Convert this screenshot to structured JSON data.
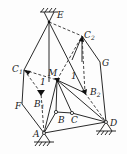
{
  "diagram": {
    "type": "linkage-mechanism",
    "points": {
      "E": {
        "label": "E",
        "x": 49,
        "y": 22
      },
      "C2": {
        "label": "C",
        "sub": "2",
        "x": 82,
        "y": 36
      },
      "G": {
        "label": "G",
        "x": 100,
        "y": 62
      },
      "C1": {
        "label": "C",
        "sub": "1",
        "x": 24,
        "y": 70
      },
      "M": {
        "label": "M",
        "x": 57,
        "y": 80
      },
      "B1": {
        "label": "B",
        "sub": "1",
        "x": 41,
        "y": 93
      },
      "B2": {
        "label": "B",
        "sub": "2",
        "x": 85,
        "y": 93
      },
      "B": {
        "label": "B",
        "x": 56,
        "y": 112
      },
      "C": {
        "label": "C",
        "x": 72,
        "y": 113
      },
      "F": {
        "label": "F",
        "x": 22,
        "y": 104
      },
      "A": {
        "label": "A",
        "x": 44,
        "y": 133
      },
      "D": {
        "label": "D",
        "x": 106,
        "y": 122
      }
    },
    "angle_marks": [
      "1",
      "1"
    ],
    "colors": {
      "line": "#2a2a2a",
      "dash": "#444444",
      "fill": "#111111"
    }
  }
}
